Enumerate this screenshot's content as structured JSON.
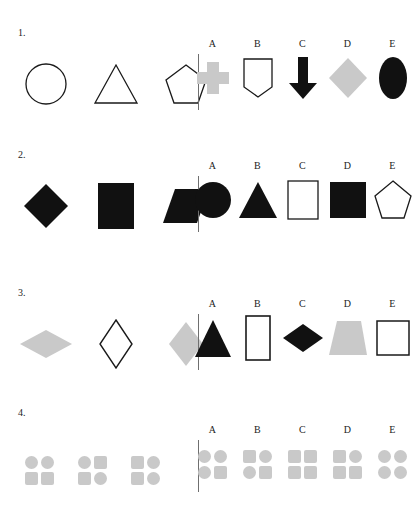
{
  "page": {
    "kind": "visual-analogy-worksheet",
    "background_color": "#ffffff",
    "ink_color": "#1a1a1a",
    "gray_fill": "#c9c9c9",
    "black_fill": "#111111",
    "divider_color": "#6f6f6f"
  },
  "option_letters": [
    "A",
    "B",
    "C",
    "D",
    "E"
  ],
  "questions": [
    {
      "number": "1.",
      "stimulus": [
        {
          "name": "circle",
          "fill": "outline"
        },
        {
          "name": "triangle",
          "fill": "outline"
        },
        {
          "name": "pentagon",
          "fill": "outline"
        }
      ],
      "options": [
        {
          "letter": "A",
          "name": "cross",
          "fill": "gray"
        },
        {
          "letter": "B",
          "name": "shield",
          "fill": "outline"
        },
        {
          "letter": "C",
          "name": "down-arrow",
          "fill": "black"
        },
        {
          "letter": "D",
          "name": "diamond",
          "fill": "gray"
        },
        {
          "letter": "E",
          "name": "ellipse",
          "fill": "black"
        }
      ]
    },
    {
      "number": "2.",
      "stimulus": [
        {
          "name": "diamond",
          "fill": "black"
        },
        {
          "name": "rectangle",
          "fill": "black"
        },
        {
          "name": "parallelogram",
          "fill": "black"
        }
      ],
      "options": [
        {
          "letter": "A",
          "name": "circle",
          "fill": "black"
        },
        {
          "letter": "B",
          "name": "triangle",
          "fill": "black"
        },
        {
          "letter": "C",
          "name": "rectangle",
          "fill": "outline"
        },
        {
          "letter": "D",
          "name": "square",
          "fill": "black"
        },
        {
          "letter": "E",
          "name": "pentagon",
          "fill": "outline"
        }
      ]
    },
    {
      "number": "3.",
      "stimulus": [
        {
          "name": "wide-rhombus",
          "fill": "gray"
        },
        {
          "name": "tall-rhombus",
          "fill": "outline"
        },
        {
          "name": "rhombus",
          "fill": "gray"
        }
      ],
      "options": [
        {
          "letter": "A",
          "name": "triangle",
          "fill": "black"
        },
        {
          "letter": "B",
          "name": "tall-rectangle",
          "fill": "outline"
        },
        {
          "letter": "C",
          "name": "wide-diamond",
          "fill": "black"
        },
        {
          "letter": "D",
          "name": "trapezoid",
          "fill": "gray"
        },
        {
          "letter": "E",
          "name": "square",
          "fill": "outline"
        }
      ]
    },
    {
      "number": "4.",
      "stimulus": [
        {
          "name": "grid-2x2",
          "cells": [
            "circle",
            "circle",
            "square",
            "square"
          ]
        },
        {
          "name": "grid-2x2",
          "cells": [
            "circle",
            "square",
            "square",
            "circle"
          ]
        },
        {
          "name": "grid-2x2",
          "cells": [
            "square",
            "circle",
            "square",
            "circle"
          ]
        }
      ],
      "options": [
        {
          "letter": "A",
          "name": "grid-2x2",
          "cells": [
            "circle",
            "circle",
            "circle",
            "square"
          ]
        },
        {
          "letter": "B",
          "name": "grid-2x2",
          "cells": [
            "square",
            "circle",
            "circle",
            "square"
          ]
        },
        {
          "letter": "C",
          "name": "grid-2x2",
          "cells": [
            "square",
            "square",
            "square",
            "square"
          ]
        },
        {
          "letter": "D",
          "name": "grid-2x2",
          "cells": [
            "square",
            "circle",
            "square",
            "square"
          ]
        },
        {
          "letter": "E",
          "name": "grid-2x2",
          "cells": [
            "circle",
            "circle",
            "circle",
            "circle"
          ]
        }
      ]
    }
  ]
}
